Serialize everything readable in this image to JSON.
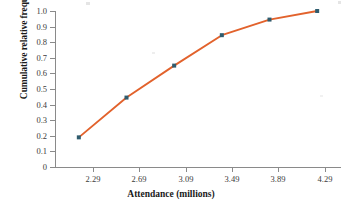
{
  "chart_data": {
    "type": "line",
    "title": "",
    "subtitle": "",
    "xlabel": "Attendance (millions)",
    "ylabel": "Cumulative relative frequency",
    "x": [
      2.29,
      2.69,
      3.09,
      3.49,
      3.89,
      4.29
    ],
    "values": [
      0.19,
      0.445,
      0.65,
      0.845,
      0.945,
      1.0
    ],
    "series": [
      {
        "name": "Cumulative relative frequency",
        "x": [
          2.29,
          2.69,
          3.09,
          3.49,
          3.89,
          4.29
        ],
        "values": [
          0.19,
          0.445,
          0.65,
          0.845,
          0.945,
          1.0
        ]
      }
    ],
    "xtick_labels": [
      "2.29",
      "2.69",
      "3.09",
      "3.49",
      "3.89",
      "4.29"
    ],
    "xticks": [
      2.29,
      2.69,
      3.09,
      3.49,
      3.89,
      4.29
    ],
    "ytick_labels": [
      "1.0",
      "0.9",
      "0.8",
      "0.7",
      "0.6",
      "0.5",
      "0.4",
      "0.3",
      "0.2",
      "0.1",
      "0"
    ],
    "yticks": [
      1.0,
      0.9,
      0.8,
      0.7,
      0.6,
      0.5,
      0.4,
      0.3,
      0.2,
      0.1,
      0
    ],
    "xlim": [
      2.09,
      4.49
    ],
    "ylim": [
      0,
      1.0
    ],
    "grid": false,
    "legend": "none",
    "line_color": "#E2622C",
    "marker_color": "#2F5C6E",
    "axis_color": "#8A8A8A",
    "text_color": "#1A1A1A",
    "background": "#FFFFFF"
  }
}
